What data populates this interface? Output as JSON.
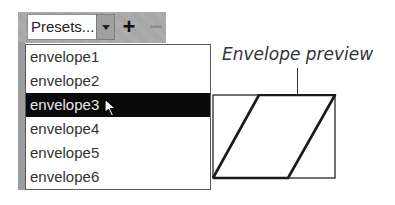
{
  "presets": {
    "combo_value": "Presets...",
    "add_label": "+",
    "remove_label": "−",
    "remove_enabled": false,
    "items": [
      {
        "label": "envelope1",
        "selected": false
      },
      {
        "label": "envelope2",
        "selected": false
      },
      {
        "label": "envelope3",
        "selected": true
      },
      {
        "label": "envelope4",
        "selected": false
      },
      {
        "label": "envelope5",
        "selected": false
      },
      {
        "label": "envelope6",
        "selected": false
      }
    ]
  },
  "preview": {
    "label": "Envelope preview"
  },
  "icons": {
    "dropdown": "chevron-down-icon",
    "cursor": "mouse-pointer-icon"
  },
  "colors": {
    "selection_bg": "#0a0a0a",
    "selection_fg": "#e8e8e8",
    "toolbar_bg": "#a9a9a9"
  }
}
